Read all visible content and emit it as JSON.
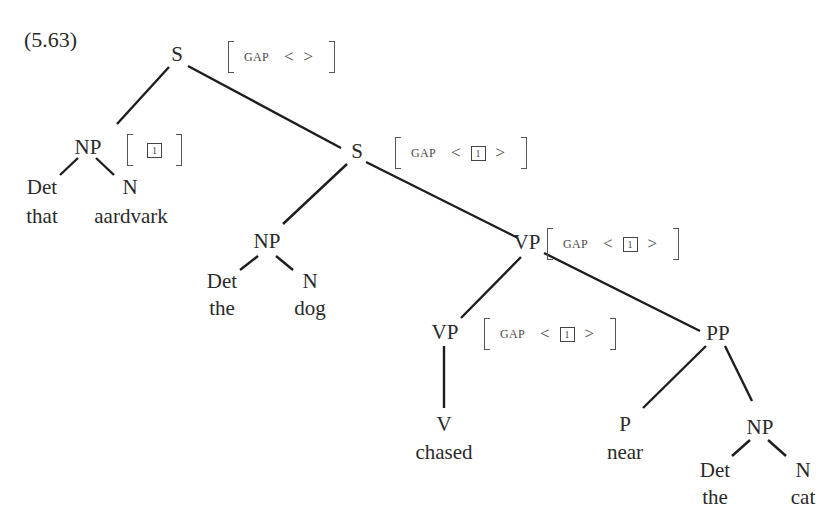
{
  "example_number": "(5.63)",
  "tree": {
    "root": {
      "label": "S",
      "avm": {
        "feature": "GAP",
        "open": "<",
        "close": ">",
        "value": ""
      }
    },
    "fronted_np": {
      "label": "NP",
      "avm": {
        "tag": "1"
      },
      "det": {
        "cat": "Det",
        "word": "that"
      },
      "n": {
        "cat": "N",
        "word": "aardvark"
      }
    },
    "inner_s": {
      "label": "S",
      "avm": {
        "feature": "GAP",
        "open": "<",
        "close": ">",
        "tag": "1"
      }
    },
    "subject_np": {
      "label": "NP",
      "det": {
        "cat": "Det",
        "word": "the"
      },
      "n": {
        "cat": "N",
        "word": "dog"
      }
    },
    "vp": {
      "label": "VP",
      "avm": {
        "feature": "GAP",
        "open": "<",
        "close": ">",
        "tag": "1"
      }
    },
    "inner_vp": {
      "label": "VP",
      "avm": {
        "feature": "GAP",
        "open": "<",
        "close": ">",
        "tag": "1"
      },
      "v": {
        "cat": "V",
        "word": "chased"
      }
    },
    "pp": {
      "label": "PP",
      "p": {
        "cat": "P",
        "word": "near"
      },
      "np": {
        "label": "NP",
        "det": {
          "cat": "Det",
          "word": "the"
        },
        "n": {
          "cat": "N",
          "word": "cat"
        }
      }
    }
  }
}
